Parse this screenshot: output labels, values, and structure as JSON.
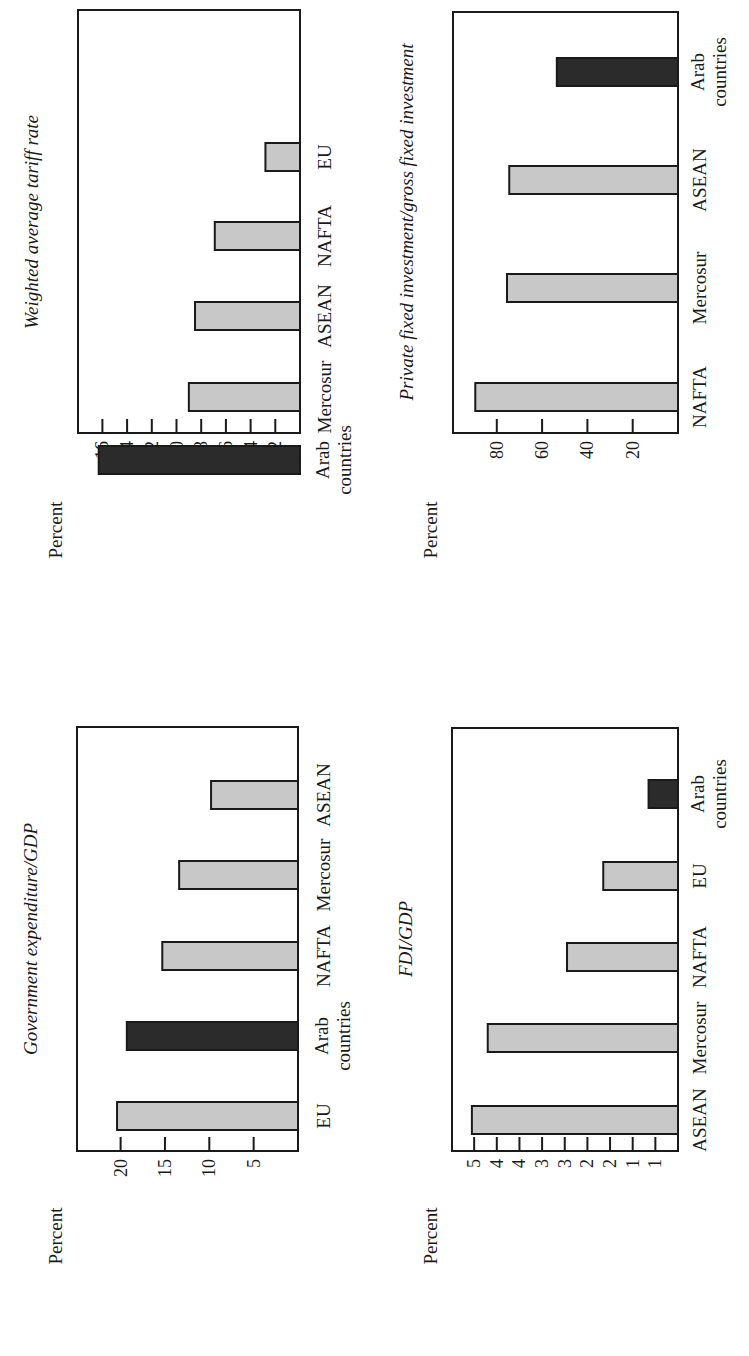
{
  "figure": {
    "orientation": "rotated 90 degrees counter-clockwise",
    "bar_colors": {
      "highlight": "#2b2b2b",
      "default": "#c8c8c8",
      "outline": "#1a1a1a"
    }
  },
  "chart_data": [
    {
      "id": "tariff",
      "type": "bar",
      "title": "Weighted average tariff rate",
      "xlabel": "",
      "ylabel": "Percent",
      "categories": [
        "Arab countries",
        "Mercosur",
        "ASEAN",
        "NAFTA",
        "EU"
      ],
      "category_lines": [
        [
          "Arab",
          "countries"
        ],
        [
          "Mercosur"
        ],
        [
          "ASEAN"
        ],
        [
          "NAFTA"
        ],
        [
          "EU"
        ]
      ],
      "values": [
        16.3,
        9.0,
        8.5,
        6.9,
        2.8
      ],
      "highlight": [
        true,
        false,
        false,
        false,
        false
      ],
      "yticks": [
        2,
        4,
        6,
        8,
        10,
        12,
        14,
        16
      ],
      "ytick_labels": [
        "2",
        "4",
        "6",
        "8",
        "10",
        "12",
        "14",
        "16"
      ],
      "ylim": [
        0,
        16.3
      ],
      "grid": false,
      "legend": null
    },
    {
      "id": "private_investment",
      "type": "bar",
      "title": "Private fixed investment/gross fixed investment",
      "xlabel": "",
      "ylabel": "Percent",
      "categories": [
        "NAFTA",
        "Mercosur",
        "ASEAN",
        "Arab countries"
      ],
      "category_lines": [
        [
          "NAFTA"
        ],
        [
          "Mercosur"
        ],
        [
          "ASEAN"
        ],
        [
          "Arab",
          "countries"
        ]
      ],
      "values": [
        89.5,
        75.5,
        74.5,
        53.5
      ],
      "highlight": [
        false,
        false,
        false,
        true
      ],
      "yticks": [
        20,
        40,
        60,
        80
      ],
      "ytick_labels": [
        "20",
        "40",
        "60",
        "80"
      ],
      "ylim": [
        0,
        90
      ],
      "grid": false,
      "legend": null
    },
    {
      "id": "gov_expenditure",
      "type": "bar",
      "title": "Government expenditure/GDP",
      "xlabel": "",
      "ylabel": "Percent",
      "categories": [
        "EU",
        "Arab countries",
        "NAFTA",
        "Mercosur",
        "ASEAN"
      ],
      "category_lines": [
        [
          "EU"
        ],
        [
          "Arab",
          "countries"
        ],
        [
          "NAFTA"
        ],
        [
          "Mercosur"
        ],
        [
          "ASEAN"
        ]
      ],
      "values": [
        20.4,
        19.3,
        15.3,
        13.4,
        9.8
      ],
      "highlight": [
        false,
        true,
        false,
        false,
        false
      ],
      "yticks": [
        5,
        10,
        15,
        20
      ],
      "ytick_labels": [
        "5",
        "10",
        "15",
        "20"
      ],
      "ylim": [
        0,
        20.2
      ],
      "grid": false,
      "legend": null
    },
    {
      "id": "fdi",
      "type": "bar",
      "title": "FDI/GDP",
      "xlabel": "",
      "ylabel": "Percent",
      "categories": [
        "ASEAN",
        "Mercosur",
        "NAFTA",
        "EU",
        "Arab countries"
      ],
      "category_lines": [
        [
          "ASEAN"
        ],
        [
          "Mercosur"
        ],
        [
          "NAFTA"
        ],
        [
          "EU"
        ],
        [
          "Arab",
          "countries"
        ]
      ],
      "values": [
        4.55,
        4.2,
        2.45,
        1.65,
        0.65
      ],
      "highlight": [
        false,
        false,
        false,
        false,
        true
      ],
      "yticks": [
        0.5,
        1.0,
        1.5,
        2.0,
        2.5,
        3.0,
        3.5,
        4.0,
        4.5
      ],
      "ytick_labels": [
        "1",
        "1",
        "2",
        "2",
        "3",
        "3",
        "4",
        "4",
        "5"
      ],
      "ylim": [
        0,
        4.5
      ],
      "grid": false,
      "legend": null
    }
  ]
}
